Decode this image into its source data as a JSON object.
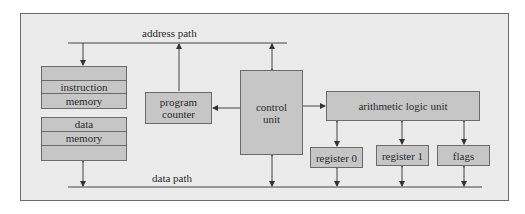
{
  "diagram": {
    "address_path_label": "address path",
    "data_path_label": "data path",
    "instruction_memory": {
      "line1": "instruction",
      "line2": "memory"
    },
    "data_memory": {
      "line1": "data",
      "line2": "memory"
    },
    "program_counter": {
      "line1": "program",
      "line2": "counter"
    },
    "control_unit": {
      "line1": "control",
      "line2": "unit"
    },
    "alu": {
      "label": "arithmetic logic unit"
    },
    "register0": {
      "label": "register 0"
    },
    "register1": {
      "label": "register 1"
    },
    "flags": {
      "label": "flags"
    },
    "colors": {
      "frame_bg": "#ebebeb",
      "box_fill": "#c6c6c6",
      "line": "#444444"
    }
  }
}
